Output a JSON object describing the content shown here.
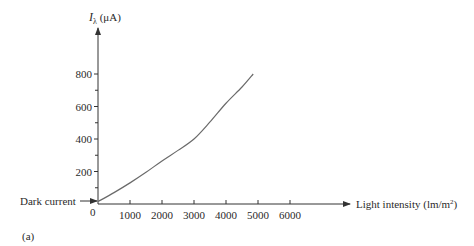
{
  "chart_data": {
    "type": "line",
    "title": "",
    "xlabel": "Light intensity (lm/m²)",
    "xlabel_main": "Light intensity (lm/m",
    "xlabel_sup": "2",
    "xlabel_close": ")",
    "ylabel_symbol": "I",
    "ylabel_sub": "λ",
    "ylabel_unit": " (μA)",
    "ylabel": "Iλ (μA)",
    "x_ticks": [
      "1000",
      "2000",
      "3000",
      "4000",
      "5000",
      "6000"
    ],
    "x_tick_values": [
      1000,
      2000,
      3000,
      4000,
      5000,
      6000
    ],
    "y_ticks": [
      "200",
      "400",
      "600",
      "800"
    ],
    "y_tick_values": [
      200,
      400,
      600,
      800
    ],
    "y_minor_ticks": [
      100,
      300,
      500,
      700
    ],
    "origin_label": "0",
    "xlim": [
      0,
      6500
    ],
    "ylim": [
      0,
      900
    ],
    "grid": false,
    "series": [
      {
        "name": "Photocurrent",
        "x": [
          0,
          500,
          1000,
          1500,
          2000,
          2500,
          3000,
          3500,
          4000,
          4500,
          4850
        ],
        "values": [
          15,
          70,
          130,
          195,
          265,
          330,
          400,
          505,
          620,
          720,
          800
        ]
      }
    ],
    "annotations": [
      {
        "text": "Dark current",
        "points_to": [
          0,
          15
        ]
      }
    ],
    "panel_label": "(a)"
  }
}
